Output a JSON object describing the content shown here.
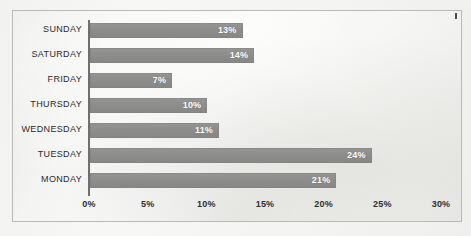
{
  "chart_data": {
    "type": "bar",
    "orientation": "horizontal",
    "title": "",
    "subtitle": "",
    "xlabel": "",
    "ylabel": "",
    "categories": [
      "SUNDAY",
      "SATURDAY",
      "FRIDAY",
      "THURSDAY",
      "WEDNESDAY",
      "TUESDAY",
      "MONDAY"
    ],
    "values": [
      13,
      14,
      7,
      10,
      11,
      24,
      21
    ],
    "data_labels": [
      "13%",
      "14%",
      "7%",
      "10%",
      "11%",
      "24%",
      "21%"
    ],
    "xlim": [
      0,
      30
    ],
    "xticks": [
      0,
      5,
      10,
      15,
      20,
      25,
      30
    ],
    "xtick_labels": [
      "0%",
      "5%",
      "10%",
      "15%",
      "20%",
      "25%",
      "30%"
    ],
    "grid": false,
    "legend": null,
    "bar_color": "#8d8d8b",
    "axis_color": "#6f6f6f",
    "label_color": "#2b2b2b",
    "value_label_color": "#ffffff",
    "plot_background": "#f4f4f2",
    "border_color": "#b9b9b7"
  }
}
